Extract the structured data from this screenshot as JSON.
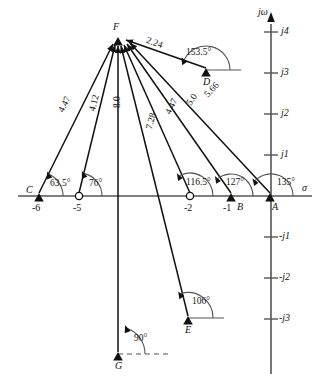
{
  "figure": {
    "type": "pole-zero-vector-diagram",
    "axes": {
      "real_axis_label": "σ",
      "imag_axis_label": "jω",
      "imag_ticks_positive": [
        "j4",
        "j3",
        "j2",
        "j1"
      ],
      "imag_ticks_negative": [
        "-j1",
        "-j2",
        "-j3"
      ],
      "real_ticks": [
        "-6",
        "-5",
        "-2",
        "-1"
      ],
      "unit_px": 41,
      "origin_px": {
        "x": 271,
        "y": 196
      }
    },
    "points": [
      {
        "id": "A",
        "label": "A",
        "marker": "pole",
        "re": 0,
        "im": 0,
        "angle": "135°",
        "magnitude": "5.66"
      },
      {
        "id": "B",
        "label": "B",
        "marker": "pole",
        "re": -1,
        "im": 0,
        "angle": "127°",
        "magnitude": "5.0"
      },
      {
        "id": "Z2",
        "label": "",
        "marker": "zero",
        "re": -2,
        "im": 0,
        "angle": "116.5°",
        "magnitude": "4.47"
      },
      {
        "id": "C",
        "label": "C",
        "marker": "pole",
        "re": -6,
        "im": 0,
        "angle": "63.5°",
        "magnitude": "4.47"
      },
      {
        "id": "Z5",
        "label": "",
        "marker": "zero",
        "re": -5,
        "im": 0,
        "angle": "76°",
        "magnitude": "4.12"
      },
      {
        "id": "D",
        "label": "D",
        "marker": "pole",
        "re": -1.55,
        "im": 3.05,
        "angle": "153.5°",
        "magnitude": "2.24"
      },
      {
        "id": "E",
        "label": "E",
        "marker": "pole",
        "re": -2.0,
        "im": -3.02,
        "angle": "106°",
        "magnitude": "7.28"
      },
      {
        "id": "G",
        "label": "G",
        "marker": "pole",
        "re": -3.73,
        "im": -3.95,
        "angle": "90°",
        "magnitude": "8.0"
      },
      {
        "id": "F",
        "label": "F",
        "marker": "apex",
        "re": -3.73,
        "im": 3.88,
        "angle": "",
        "magnitude": ""
      }
    ],
    "vector_magnitudes": [
      "2.24",
      "4.47",
      "4.12",
      "8.0",
      "7.28",
      "4.47",
      "5.0",
      "5.66"
    ],
    "angle_labels": [
      "153.5°",
      "63.5°",
      "76°",
      "116.5°",
      "127°",
      "135°",
      "106°",
      "90°"
    ],
    "colors": {
      "ink": "#111111",
      "axis": "#555555",
      "background": "#ffffff"
    }
  }
}
